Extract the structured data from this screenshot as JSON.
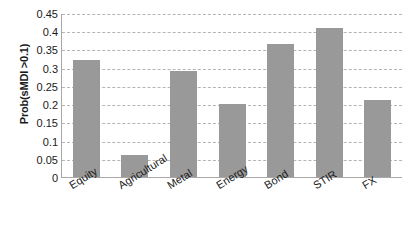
{
  "chart_data": {
    "type": "bar",
    "title": "",
    "xlabel": "",
    "ylabel": "Prob(sMDI >0.1)",
    "categories": [
      "Equity",
      "Agricultural",
      "Metal",
      "Energy",
      "Bond",
      "STIR",
      "FX"
    ],
    "values": [
      0.32,
      0.06,
      0.29,
      0.2,
      0.365,
      0.41,
      0.21
    ],
    "ylim": [
      0,
      0.45
    ],
    "ytick_values": [
      0,
      0.05,
      0.1,
      0.15,
      0.2,
      0.25,
      0.3,
      0.35,
      0.4,
      0.45
    ],
    "ytick_labels": [
      "0",
      "0.05",
      "0.1",
      "0.15",
      "0.2",
      "0.25",
      "0.3",
      "0.35",
      "0.4",
      "0.45"
    ],
    "grid": true,
    "grid_style": "dashed-horizontal",
    "legend": null,
    "bar_color": "#999999",
    "grid_color": "#b4b4b4",
    "axis_color": "#a8a8a8",
    "text_color": "#1a1a1a"
  }
}
